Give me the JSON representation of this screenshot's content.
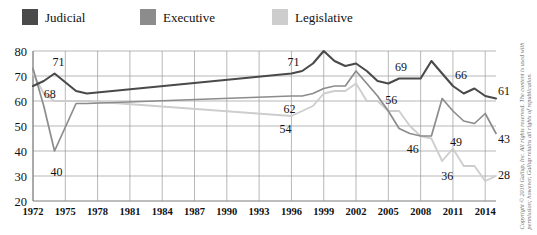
{
  "legend": {
    "items": [
      {
        "label": "Judicial",
        "color": "#4a4a4a",
        "icon": "legend-swatch-icon"
      },
      {
        "label": "Executive",
        "color": "#8c8c8c",
        "icon": "legend-swatch-icon"
      },
      {
        "label": "Legislative",
        "color": "#cdcdcd",
        "icon": "legend-swatch-icon"
      }
    ]
  },
  "copyright": {
    "text": "Copyright © 2019 Gallup, Inc. All rights reserved. The content is used with permission; however, Gallup retains all rights of republication."
  },
  "chart_data": {
    "type": "line",
    "title": "",
    "subtitle": "",
    "xlabel": "",
    "ylabel": "",
    "xlim": [
      1972,
      2015
    ],
    "ylim": [
      20,
      80
    ],
    "yticks": [
      20,
      30,
      40,
      50,
      60,
      70,
      80
    ],
    "xticks": [
      1972,
      1975,
      1978,
      1981,
      1984,
      1987,
      1990,
      1993,
      1996,
      1999,
      2002,
      2005,
      2008,
      2011,
      2014
    ],
    "grid": true,
    "legend_position": "top-left",
    "series": [
      {
        "name": "Judicial",
        "color": "#4a4a4a",
        "width": 2.1,
        "x": [
          1972,
          1973,
          1974,
          1976,
          1977,
          1996,
          1997,
          1998,
          1999,
          2000,
          2001,
          2002,
          2003,
          2004,
          2005,
          2006,
          2007,
          2008,
          2009,
          2010,
          2011,
          2012,
          2013,
          2014,
          2015
        ],
        "y": [
          66,
          68,
          71,
          64,
          63,
          71,
          72,
          75,
          80,
          76,
          74,
          75,
          72,
          68,
          67,
          69,
          69,
          69,
          76,
          71,
          66,
          63,
          65,
          62,
          61
        ]
      },
      {
        "name": "Executive",
        "color": "#8c8c8c",
        "width": 1.7,
        "x": [
          1972,
          1973,
          1974,
          1976,
          1977,
          1996,
          1997,
          1998,
          1999,
          2000,
          2001,
          2002,
          2003,
          2004,
          2005,
          2006,
          2007,
          2008,
          2009,
          2010,
          2011,
          2012,
          2013,
          2014,
          2015
        ],
        "y": [
          73,
          58,
          40,
          59,
          59,
          62,
          62,
          63,
          65,
          66,
          66,
          72,
          67,
          62,
          56,
          49,
          47,
          46,
          46,
          61,
          56,
          52,
          51,
          55,
          47
        ]
      },
      {
        "name": "Legislative",
        "color": "#cdcdcd",
        "width": 1.8,
        "x": [
          1972,
          1973,
          1974,
          1976,
          1977,
          1996,
          1997,
          1998,
          1999,
          2000,
          2001,
          2002,
          2003,
          2004,
          2005,
          2006,
          2007,
          2008,
          2009,
          2010,
          2011,
          2012,
          2013,
          2014,
          2015
        ],
        "y": [
          71,
          63,
          60,
          60,
          60,
          54,
          56,
          58,
          63,
          64,
          64,
          67,
          60,
          60,
          56,
          56,
          50,
          46,
          45,
          36,
          41,
          34,
          34,
          28,
          30
        ]
      }
    ],
    "annotations": [
      {
        "text": "71",
        "x": 1974,
        "y": 71,
        "dx": 4,
        "dy": -8,
        "series": "Judicial"
      },
      {
        "text": "68",
        "x": 1973,
        "y": 68,
        "dx": 6,
        "dy": 17,
        "series": "Judicial"
      },
      {
        "text": "40",
        "x": 1974,
        "y": 40,
        "dx": 2,
        "dy": 25,
        "series": "Executive"
      },
      {
        "text": "71",
        "x": 1996,
        "y": 71,
        "dx": 2,
        "dy": -8,
        "series": "Judicial"
      },
      {
        "text": "62",
        "x": 1996,
        "y": 62,
        "dx": -2,
        "dy": 17,
        "series": "Executive"
      },
      {
        "text": "54",
        "x": 1996,
        "y": 54,
        "dx": -6,
        "dy": 17,
        "series": "Legislative"
      },
      {
        "text": "69",
        "x": 2006,
        "y": 69,
        "dx": 2,
        "dy": -8,
        "series": "Judicial"
      },
      {
        "text": "56",
        "x": 2005,
        "y": 56,
        "dx": 3,
        "dy": -7,
        "series": "Executive"
      },
      {
        "text": "46",
        "x": 2008,
        "y": 46,
        "dx": -8,
        "dy": 17,
        "series": "Executive"
      },
      {
        "text": "66",
        "x": 2011,
        "y": 66,
        "dx": 8,
        "dy": -7,
        "series": "Judicial"
      },
      {
        "text": "49",
        "x": 2011,
        "y": 49,
        "dx": 3,
        "dy": 17,
        "series": "Executive"
      },
      {
        "text": "36",
        "x": 2010,
        "y": 36,
        "dx": 5,
        "dy": 19,
        "series": "Legislative"
      },
      {
        "text": "61",
        "x": 2015,
        "y": 61,
        "dx": 8,
        "dy": -4,
        "series": "Judicial"
      },
      {
        "text": "43",
        "x": 2015,
        "y": 47,
        "dx": 8,
        "dy": 9,
        "series": "Executive"
      },
      {
        "text": "28",
        "x": 2015,
        "y": 30,
        "dx": 8,
        "dy": 3,
        "series": "Legislative"
      }
    ]
  }
}
